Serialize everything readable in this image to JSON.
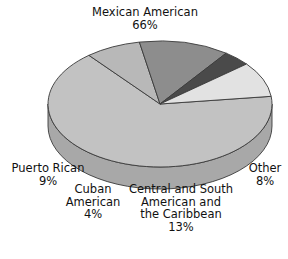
{
  "chart_data": {
    "type": "pie",
    "title": "",
    "xlabel": "",
    "ylabel": "",
    "units": "percent",
    "three_d": true,
    "legend_position": "none",
    "grid": false,
    "labels_inline": true,
    "categories": [
      "Mexican American",
      "Other",
      "Central and South American and the Caribbean",
      "Cuban American",
      "Puerto Rican"
    ],
    "values": [
      66,
      8,
      13,
      4,
      9
    ],
    "slices": [
      {
        "name": "Mexican American",
        "value": 66,
        "value_label": "66%",
        "label_lines": [
          "Mexican American",
          "66%"
        ],
        "color": "#c2c2c2",
        "side_color": "#a8a8a8"
      },
      {
        "name": "Other",
        "value": 8,
        "value_label": "8%",
        "label_lines": [
          "Other",
          "8%"
        ],
        "color": "#b8b8b8",
        "side_color": "#9e9e9e"
      },
      {
        "name": "Central and South American and the Caribbean",
        "value": 13,
        "value_label": "13%",
        "label_lines": [
          "Central and South",
          "American and",
          "the Caribbean",
          "13%"
        ],
        "color": "#8d8d8d",
        "side_color": "#787878"
      },
      {
        "name": "Cuban American",
        "value": 4,
        "value_label": "4%",
        "label_lines": [
          "Cuban",
          "American",
          "4%"
        ],
        "color": "#4a4a4a",
        "side_color": "#3a3a3a"
      },
      {
        "name": "Puerto Rican",
        "value": 9,
        "value_label": "9%",
        "label_lines": [
          "Puerto Rican",
          "9%"
        ],
        "color": "#e2e2e2",
        "side_color": "#c6c6c6"
      }
    ],
    "total": 100,
    "outline_color": "#3a3a3a",
    "background": "#ffffff"
  },
  "labels": {
    "mexican": {
      "line1": "Mexican American",
      "line2": "66%"
    },
    "puerto_rican": {
      "line1": "Puerto Rican",
      "line2": "9%"
    },
    "cuban": {
      "line1": "Cuban",
      "line2": "American",
      "line3": "4%"
    },
    "central": {
      "line1": "Central and South",
      "line2": "American and",
      "line3": "the Caribbean",
      "line4": "13%"
    },
    "other": {
      "line1": "Other",
      "line2": "8%"
    }
  }
}
